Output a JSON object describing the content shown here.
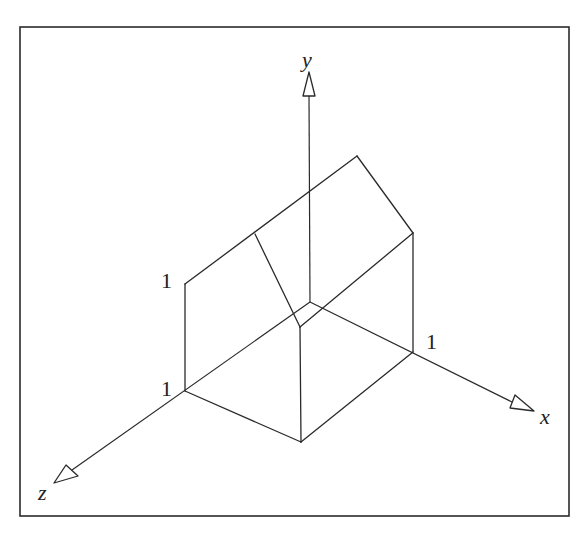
{
  "figure": {
    "type": "isometric-axes-diagram",
    "axes": {
      "x": {
        "label": "x"
      },
      "y": {
        "label": "y"
      },
      "z": {
        "label": "z"
      }
    },
    "tick_labels": {
      "y_one": "1",
      "z_one": "1",
      "x_one": "1"
    },
    "colors": {
      "line": "#2a2a2a",
      "background": "#ffffff"
    }
  }
}
